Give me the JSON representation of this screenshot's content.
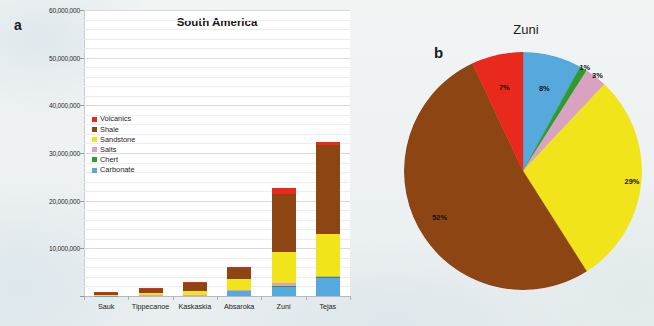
{
  "panels": {
    "bar_letter": "a",
    "pie_letter": "b"
  },
  "colors": {
    "volcanics": "#E8291C",
    "shale": "#8C4513",
    "sandstone": "#F2E41B",
    "salts": "#D9A2C0",
    "chert": "#2E9B2E",
    "carbonate": "#56A9DC",
    "plot_background": "#FFFFFF",
    "page_background": "#EDF1F2",
    "text": "#1A1A1A"
  },
  "chart_data": [
    {
      "type": "bar",
      "id": "south-america-stacked-bar",
      "title": "South America",
      "xlabel": "",
      "ylabel": "",
      "ylim": [
        0,
        60000000
      ],
      "yticks": [
        0,
        10000000,
        20000000,
        30000000,
        40000000,
        50000000,
        60000000
      ],
      "ytick_labels": [
        "",
        "10,000,000",
        "20,000,000",
        "30,000,000",
        "40,000,000",
        "50,000,000",
        "60,000,000"
      ],
      "grid": true,
      "stacked": true,
      "legend_position": "inside-upper-left",
      "categories": [
        "Sauk",
        "Tippecanoe",
        "Kaskaskia",
        "Absaroka",
        "Zuni",
        "Tejas"
      ],
      "series": [
        {
          "name": "Carbonate",
          "color": "#56A9DC",
          "values": [
            100000,
            150000,
            200000,
            1100000,
            1900000,
            3900000
          ]
        },
        {
          "name": "Chert",
          "color": "#2E9B2E",
          "values": [
            10000,
            15000,
            20000,
            60000,
            200000,
            150000
          ]
        },
        {
          "name": "Salts",
          "color": "#D9A2C0",
          "values": [
            10000,
            20000,
            30000,
            80000,
            600000,
            250000
          ]
        },
        {
          "name": "Sandstone",
          "color": "#F2E41B",
          "values": [
            150000,
            400000,
            800000,
            2400000,
            6600000,
            8700000
          ]
        },
        {
          "name": "Shale",
          "color": "#8C4513",
          "values": [
            500000,
            1000000,
            1800000,
            2300000,
            12000000,
            18700000
          ]
        },
        {
          "name": "Volcanics",
          "color": "#E8291C",
          "values": [
            30000,
            40000,
            60000,
            60000,
            1400000,
            650000
          ]
        }
      ],
      "totals": [
        800000,
        1625000,
        2910000,
        6000000,
        22700000,
        32350000
      ]
    },
    {
      "type": "pie",
      "id": "zuni-pie",
      "title": "Zuni",
      "start_angle_deg": 0,
      "direction": "clockwise",
      "labels": [
        "Carbonate",
        "Chert",
        "Salts",
        "Sandstone",
        "Shale",
        "Volcanics"
      ],
      "values": [
        8,
        1,
        3,
        29,
        52,
        7
      ],
      "value_labels": [
        "8%",
        "1%",
        "3%",
        "29%",
        "52%",
        "7%"
      ],
      "colors": [
        "#56A9DC",
        "#2E9B2E",
        "#D9A2C0",
        "#F2E41B",
        "#8C4513",
        "#E8291C"
      ]
    }
  ],
  "legend": {
    "items": [
      {
        "label": "Volcanics",
        "color": "#E8291C"
      },
      {
        "label": "Shale",
        "color": "#8C4513"
      },
      {
        "label": "Sandstone",
        "color": "#F2E41B"
      },
      {
        "label": "Salts",
        "color": "#D9A2C0"
      },
      {
        "label": "Chert",
        "color": "#2E9B2E"
      },
      {
        "label": "Carbonate",
        "color": "#56A9DC"
      }
    ]
  }
}
